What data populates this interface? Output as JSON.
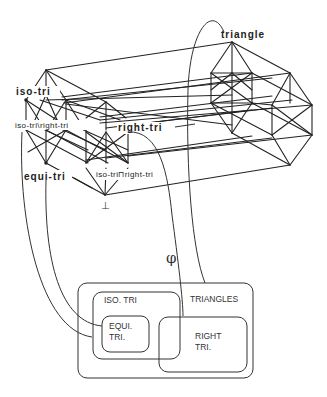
{
  "diagram": {
    "type": "concept-lattice-to-venn-mapping",
    "lattice": {
      "nodes": {
        "top": "triangle",
        "iso": "iso-tri",
        "right": "right-tri",
        "iso_minus_right": "iso-tri\\right-tri",
        "equi": "equi-tri",
        "iso_meet_right": "iso-tri⊓right-tri",
        "bottom": "⊥"
      }
    },
    "mapping_symbol": "φ",
    "venn": {
      "outer": "TRIANGLES",
      "iso": "ISO. TRI",
      "equi_line1": "EQUI.",
      "equi_line2": "TRI.",
      "right_line1": "RIGHT",
      "right_line2": "TRI."
    },
    "colors": {
      "line": "#222222",
      "background": "#ffffff"
    }
  }
}
